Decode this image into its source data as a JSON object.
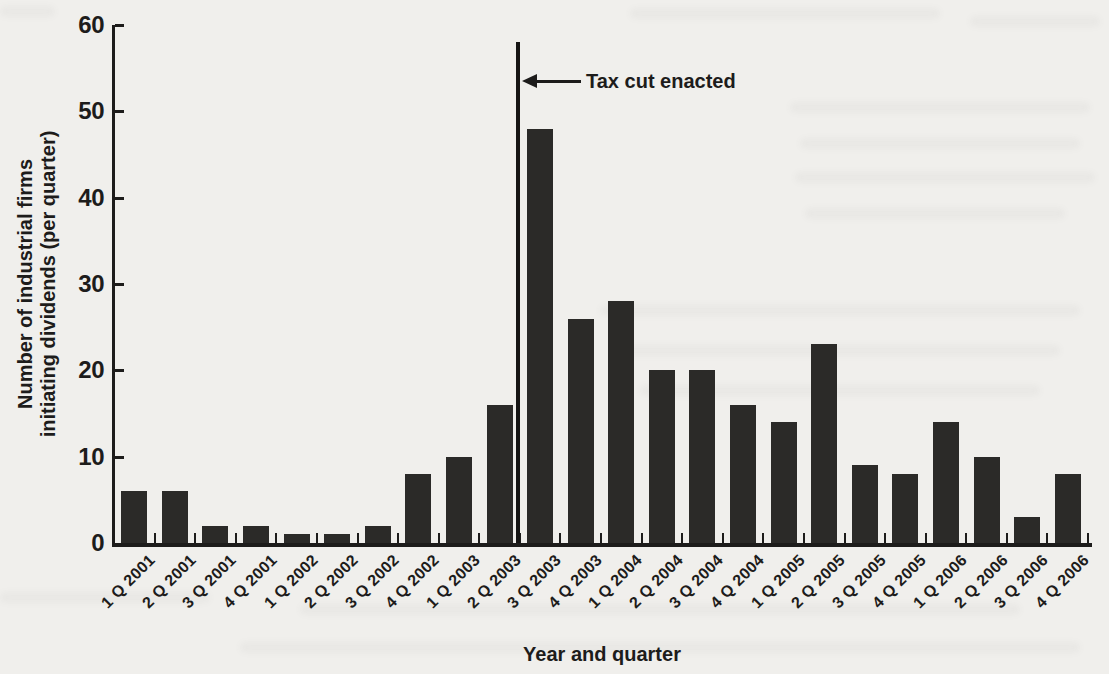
{
  "chart_data": {
    "type": "bar",
    "title": "",
    "categories": [
      "1 Q 2001",
      "2 Q 2001",
      "3 Q 2001",
      "4 Q 2001",
      "1 Q 2002",
      "2 Q 2002",
      "3 Q 2002",
      "4 Q 2002",
      "1 Q 2003",
      "2 Q 2003",
      "3 Q 2003",
      "4 Q 2003",
      "1 Q 2004",
      "2 Q 2004",
      "3 Q 2004",
      "4 Q 2004",
      "1 Q 2005",
      "2 Q 2005",
      "3 Q 2005",
      "4 Q 2005",
      "1 Q 2006",
      "2 Q 2006",
      "3 Q 2006",
      "4 Q 2006"
    ],
    "values": [
      6,
      6,
      2,
      2,
      1,
      1,
      2,
      8,
      10,
      16,
      48,
      26,
      28,
      20,
      20,
      16,
      14,
      23,
      9,
      8,
      14,
      10,
      3,
      8
    ],
    "xlabel": "Year and quarter",
    "ylabel_lines": [
      "Number of industrial firms",
      "initiating dividends (per quarter)"
    ],
    "ylim": [
      0,
      60
    ],
    "yticks": [
      0,
      10,
      20,
      30,
      40,
      50,
      60
    ],
    "grid": false,
    "legend": "none",
    "bar_color": "#2b2a28",
    "ink_color": "#1d1c1b",
    "paper_color": "#f0efec",
    "annotation": {
      "text": "Tax cut enacted",
      "between_categories": [
        "2 Q 2003",
        "3 Q 2003"
      ],
      "line_boundary_index": 10,
      "line_top_value": 58,
      "arrow_y_value": 53.5
    }
  }
}
